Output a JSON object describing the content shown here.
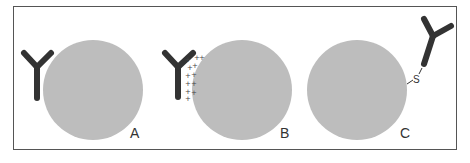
{
  "panels": [
    {
      "label": "A",
      "description": "Antibody adjacent to particle (physical adsorption)"
    },
    {
      "label": "B",
      "description": "Antibody bound via electrostatic interaction",
      "charge_symbol": "+"
    },
    {
      "label": "C",
      "description": "Antibody covalently linked via sulfur",
      "linker_symbol": "S"
    }
  ],
  "colors": {
    "particle": "#bdbdbd",
    "antibody": "#333333",
    "border": "#555555"
  }
}
